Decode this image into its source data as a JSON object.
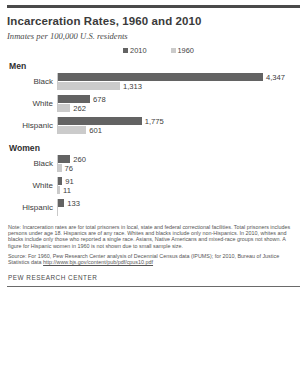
{
  "header": {
    "title": "Incarceration Rates, 1960 and 2010",
    "subtitle": "Inmates per 100,000 U.S. residents"
  },
  "legend": {
    "items": [
      {
        "label": "2010",
        "color": "#636363"
      },
      {
        "label": "1960",
        "color": "#cbcbcb"
      }
    ]
  },
  "groups": [
    {
      "title": "Men",
      "rows": [
        {
          "label": "Black",
          "v2010": 4347,
          "v2010_text": "4,347",
          "v1960": 1313,
          "v1960_text": "1,313"
        },
        {
          "label": "White",
          "v2010": 678,
          "v2010_text": "678",
          "v1960": 262,
          "v1960_text": "262"
        },
        {
          "label": "Hispanic",
          "v2010": 1775,
          "v2010_text": "1,775",
          "v1960": 601,
          "v1960_text": "601"
        }
      ]
    },
    {
      "title": "Women",
      "rows": [
        {
          "label": "Black",
          "v2010": 260,
          "v2010_text": "260",
          "v1960": 76,
          "v1960_text": "76"
        },
        {
          "label": "White",
          "v2010": 91,
          "v2010_text": "91",
          "v1960": 11,
          "v1960_text": "11"
        },
        {
          "label": "Hispanic",
          "v2010": 133,
          "v2010_text": "133",
          "v1960": null,
          "v1960_text": ""
        }
      ]
    }
  ],
  "footer": {
    "note": "Note: Incarceration rates are for total prisoners in local, state and federal correctional facilities. Total prisoners includes persons under age 18. Hispanics are of any race. Whites and blacks include only non-Hispanics. In 2010, whites and blacks include only those who reported a single race. Asians, Native Americans and mixed-race groups not shown. A figure for Hispanic women in 1960 is not shown due to small sample size.",
    "source_prefix": "Source: For 1960, Pew Research Center analysis of Decennial Census data (IPUMS); for 2010, Bureau of Justice Statistics data ",
    "source_url": "http://www.bjs.gov/content/pub/pdf/cpus10.pdf",
    "credit": "PEW RESEARCH CENTER"
  },
  "chart_data": {
    "type": "bar",
    "title": "Incarceration Rates, 1960 and 2010",
    "subtitle": "Inmates per 100,000 U.S. residents",
    "xlabel": "Inmates per 100,000 U.S. residents",
    "ylabel": "",
    "orientation": "horizontal",
    "grid": false,
    "legend_position": "top-center",
    "xlim": [
      0,
      4347
    ],
    "categories": [
      "Men - Black",
      "Men - White",
      "Men - Hispanic",
      "Women - Black",
      "Women - White",
      "Women - Hispanic"
    ],
    "series": [
      {
        "name": "2010",
        "color": "#636363",
        "values": [
          4347,
          678,
          1775,
          260,
          91,
          133
        ]
      },
      {
        "name": "1960",
        "color": "#cbcbcb",
        "values": [
          1313,
          262,
          601,
          76,
          11,
          null
        ]
      }
    ],
    "annotations": [
      "A figure for Hispanic women in 1960 is not shown due to small sample size."
    ]
  }
}
